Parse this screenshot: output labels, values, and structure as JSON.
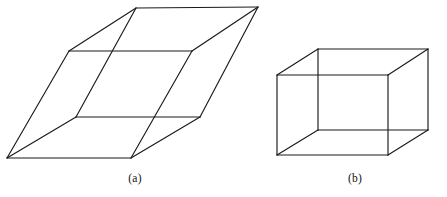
{
  "page": {
    "background_color": "#ffffff",
    "stroke_color": "#1a1a1a",
    "width": 447,
    "height": 197
  },
  "figures": [
    {
      "id": "figure-a",
      "caption": "(a)",
      "shape_name": "sheared-parallelepiped",
      "vertices": {
        "top_back_left": [
          136,
          8
        ],
        "top_back_right": [
          258,
          7
        ],
        "top_front_left": [
          69,
          51
        ],
        "top_front_right": [
          192,
          51
        ],
        "bottom_back_left": [
          76,
          117
        ],
        "bottom_back_right": [
          200,
          117
        ],
        "bottom_front_left": [
          7,
          158
        ],
        "bottom_front_right": [
          131,
          158
        ]
      },
      "edges": [
        [
          "top_back_left",
          "top_back_right"
        ],
        [
          "top_back_left",
          "top_front_left"
        ],
        [
          "top_back_right",
          "top_front_right"
        ],
        [
          "top_front_left",
          "top_front_right"
        ],
        [
          "top_front_left",
          "bottom_front_left"
        ],
        [
          "top_front_right",
          "bottom_front_right"
        ],
        [
          "top_back_right",
          "bottom_back_right"
        ],
        [
          "bottom_back_left",
          "bottom_back_right"
        ],
        [
          "bottom_back_left",
          "bottom_front_left"
        ],
        [
          "bottom_back_right",
          "bottom_front_right"
        ],
        [
          "bottom_front_left",
          "bottom_front_right"
        ],
        [
          "top_back_left",
          "bottom_back_left"
        ]
      ]
    },
    {
      "id": "figure-b",
      "caption": "(b)",
      "shape_name": "rectangular-box",
      "vertices": {
        "top_back_left": [
          318,
          49
        ],
        "top_back_right": [
          428,
          49
        ],
        "top_front_left": [
          277,
          75
        ],
        "top_front_right": [
          388,
          75
        ],
        "bottom_back_left": [
          318,
          130
        ],
        "bottom_back_right": [
          428,
          130
        ],
        "bottom_front_left": [
          277,
          155
        ],
        "bottom_front_right": [
          388,
          155
        ]
      },
      "edges": [
        [
          "top_back_left",
          "top_back_right"
        ],
        [
          "top_back_left",
          "top_front_left"
        ],
        [
          "top_back_right",
          "top_front_right"
        ],
        [
          "top_front_left",
          "top_front_right"
        ],
        [
          "top_front_left",
          "bottom_front_left"
        ],
        [
          "top_front_right",
          "bottom_front_right"
        ],
        [
          "top_back_right",
          "bottom_back_right"
        ],
        [
          "bottom_back_right",
          "bottom_front_right"
        ],
        [
          "bottom_front_left",
          "bottom_front_right"
        ],
        [
          "top_back_left",
          "bottom_back_left"
        ],
        [
          "bottom_back_left",
          "bottom_back_right"
        ],
        [
          "bottom_back_left",
          "bottom_front_left"
        ]
      ]
    }
  ]
}
